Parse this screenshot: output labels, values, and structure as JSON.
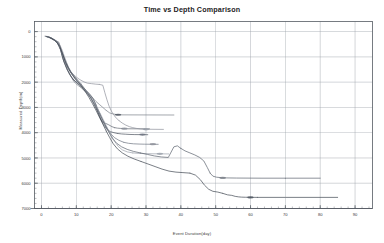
{
  "chart_data": {
    "type": "line",
    "title": "Time vs Depth Comparison",
    "xlabel": "Event Duration(day)",
    "ylabel": "Measured Depth(m)",
    "xlim": [
      -2,
      95
    ],
    "ylim": [
      7000,
      -400
    ],
    "y_inverted": true,
    "grid": true,
    "legend": "none",
    "xticks": [
      0,
      10,
      20,
      30,
      40,
      50,
      60,
      70,
      80,
      90
    ],
    "yticks": [
      0,
      1000,
      2000,
      3000,
      4000,
      5000,
      6000,
      7000
    ],
    "x_minor_tick_step": 2,
    "y_minor_tick_step": 200,
    "series": [
      {
        "name": "Well 1",
        "color": "#7a7f88",
        "points": [
          [
            1.0,
            180
          ],
          [
            2.2,
            200
          ],
          [
            3.0,
            300
          ],
          [
            3.6,
            330
          ],
          [
            4.2,
            360
          ],
          [
            5.0,
            420
          ],
          [
            5.6,
            700
          ],
          [
            6.0,
            980
          ],
          [
            6.4,
            1180
          ],
          [
            6.9,
            1300
          ],
          [
            7.4,
            1500
          ],
          [
            8.0,
            1680
          ],
          [
            8.6,
            1810
          ],
          [
            9.2,
            1950
          ],
          [
            9.8,
            2050
          ],
          [
            10.6,
            2140
          ],
          [
            11.4,
            2220
          ],
          [
            12.2,
            2330
          ],
          [
            13.0,
            2420
          ],
          [
            14.0,
            2520
          ],
          [
            14.8,
            2640
          ],
          [
            15.6,
            2760
          ],
          [
            16.6,
            2880
          ],
          [
            17.6,
            3000
          ],
          [
            18.6,
            3120
          ],
          [
            19.6,
            3220
          ],
          [
            20.6,
            3260
          ],
          [
            21.4,
            3280
          ],
          [
            22.0,
            3290
          ],
          [
            22.6,
            3295
          ],
          [
            38.0,
            3300
          ]
        ]
      },
      {
        "name": "Well 2",
        "color": "#5f6570",
        "points": [
          [
            1.2,
            190
          ],
          [
            2.5,
            230
          ],
          [
            3.4,
            320
          ],
          [
            4.4,
            400
          ],
          [
            5.2,
            560
          ],
          [
            5.8,
            880
          ],
          [
            6.3,
            1130
          ],
          [
            6.9,
            1340
          ],
          [
            7.6,
            1540
          ],
          [
            8.3,
            1720
          ],
          [
            9.0,
            1880
          ],
          [
            9.8,
            1980
          ],
          [
            10.8,
            2080
          ],
          [
            11.8,
            2200
          ],
          [
            12.8,
            2320
          ],
          [
            13.8,
            2460
          ],
          [
            14.8,
            2640
          ],
          [
            15.6,
            2900
          ],
          [
            16.2,
            3180
          ],
          [
            16.8,
            3400
          ],
          [
            17.4,
            3560
          ],
          [
            18.2,
            3620
          ],
          [
            19.2,
            3680
          ],
          [
            20.2,
            3760
          ],
          [
            21.0,
            3800
          ],
          [
            21.8,
            3820
          ],
          [
            22.6,
            3830
          ],
          [
            23.6,
            3840
          ],
          [
            24.4,
            3845
          ],
          [
            31.0,
            3850
          ]
        ]
      },
      {
        "name": "Well 3",
        "color": "#8d9099",
        "points": [
          [
            1.6,
            200
          ],
          [
            3.0,
            260
          ],
          [
            4.0,
            340
          ],
          [
            4.8,
            420
          ],
          [
            5.4,
            560
          ],
          [
            6.0,
            760
          ],
          [
            6.6,
            1000
          ],
          [
            7.2,
            1220
          ],
          [
            7.8,
            1420
          ],
          [
            8.4,
            1580
          ],
          [
            9.2,
            1700
          ],
          [
            10.0,
            1800
          ],
          [
            11.0,
            1900
          ],
          [
            12.2,
            1990
          ],
          [
            13.2,
            2040
          ],
          [
            14.4,
            2060
          ],
          [
            15.6,
            2080
          ],
          [
            16.6,
            2090
          ],
          [
            17.6,
            2120
          ],
          [
            18.2,
            2420
          ],
          [
            18.8,
            2700
          ],
          [
            19.4,
            2950
          ],
          [
            20.2,
            3180
          ],
          [
            21.2,
            3380
          ],
          [
            22.2,
            3520
          ],
          [
            23.2,
            3620
          ],
          [
            24.2,
            3700
          ],
          [
            25.2,
            3760
          ],
          [
            26.2,
            3800
          ],
          [
            27.2,
            3830
          ],
          [
            28.4,
            3850
          ],
          [
            29.6,
            3860
          ],
          [
            31.0,
            3865
          ],
          [
            35.0,
            3870
          ]
        ]
      },
      {
        "name": "Well 4",
        "color": "#4a515d",
        "points": [
          [
            1.4,
            195
          ],
          [
            2.8,
            250
          ],
          [
            3.8,
            350
          ],
          [
            4.6,
            470
          ],
          [
            5.4,
            700
          ],
          [
            6.0,
            980
          ],
          [
            6.6,
            1250
          ],
          [
            7.2,
            1460
          ],
          [
            7.9,
            1640
          ],
          [
            8.6,
            1800
          ],
          [
            9.4,
            1930
          ],
          [
            10.2,
            2040
          ],
          [
            11.2,
            2160
          ],
          [
            12.2,
            2300
          ],
          [
            13.2,
            2460
          ],
          [
            14.2,
            2640
          ],
          [
            15.0,
            2860
          ],
          [
            15.8,
            3080
          ],
          [
            16.6,
            3320
          ],
          [
            17.4,
            3560
          ],
          [
            18.2,
            3760
          ],
          [
            19.0,
            3900
          ],
          [
            19.8,
            3960
          ],
          [
            20.8,
            4000
          ],
          [
            21.8,
            4030
          ],
          [
            23.0,
            4050
          ],
          [
            24.2,
            4060
          ],
          [
            25.4,
            4070
          ],
          [
            26.8,
            4075
          ],
          [
            30.5,
            4080
          ]
        ]
      },
      {
        "name": "Well 5",
        "color": "#6b7280",
        "points": [
          [
            1.8,
            210
          ],
          [
            3.2,
            280
          ],
          [
            4.2,
            380
          ],
          [
            5.0,
            520
          ],
          [
            5.8,
            760
          ],
          [
            6.4,
            1020
          ],
          [
            7.0,
            1280
          ],
          [
            7.8,
            1480
          ],
          [
            8.6,
            1660
          ],
          [
            9.4,
            1820
          ],
          [
            10.2,
            1960
          ],
          [
            11.2,
            2100
          ],
          [
            12.2,
            2260
          ],
          [
            13.2,
            2420
          ],
          [
            14.2,
            2580
          ],
          [
            15.2,
            2760
          ],
          [
            16.0,
            3000
          ],
          [
            16.8,
            3260
          ],
          [
            17.6,
            3500
          ],
          [
            18.4,
            3720
          ],
          [
            19.2,
            3900
          ],
          [
            20.0,
            4060
          ],
          [
            21.0,
            4200
          ],
          [
            22.2,
            4300
          ],
          [
            23.6,
            4380
          ],
          [
            25.0,
            4420
          ],
          [
            26.4,
            4440
          ],
          [
            28.0,
            4450
          ],
          [
            29.6,
            4455
          ],
          [
            33.5,
            4460
          ]
        ]
      },
      {
        "name": "Well 6",
        "color": "#9aa0aa",
        "points": [
          [
            2.0,
            220
          ],
          [
            3.4,
            300
          ],
          [
            4.4,
            400
          ],
          [
            5.2,
            600
          ],
          [
            6.0,
            880
          ],
          [
            6.8,
            1160
          ],
          [
            7.6,
            1400
          ],
          [
            8.4,
            1600
          ],
          [
            9.2,
            1780
          ],
          [
            10.0,
            1940
          ],
          [
            11.0,
            2080
          ],
          [
            12.0,
            2240
          ],
          [
            13.0,
            2420
          ],
          [
            14.0,
            2600
          ],
          [
            15.0,
            2800
          ],
          [
            16.0,
            3020
          ],
          [
            17.0,
            3280
          ],
          [
            18.0,
            3560
          ],
          [
            19.0,
            3840
          ],
          [
            20.0,
            4100
          ],
          [
            21.0,
            4340
          ],
          [
            22.0,
            4540
          ],
          [
            23.2,
            4680
          ],
          [
            24.6,
            4760
          ],
          [
            26.2,
            4800
          ],
          [
            28.0,
            4820
          ],
          [
            30.0,
            4830
          ],
          [
            32.0,
            4835
          ],
          [
            36.5,
            4840
          ]
        ]
      },
      {
        "name": "Well 7",
        "color": "#585f6b",
        "points": [
          [
            1.5,
            200
          ],
          [
            3.0,
            270
          ],
          [
            4.2,
            390
          ],
          [
            5.2,
            580
          ],
          [
            6.0,
            860
          ],
          [
            6.8,
            1140
          ],
          [
            7.6,
            1380
          ],
          [
            8.4,
            1580
          ],
          [
            9.4,
            1760
          ],
          [
            10.4,
            1920
          ],
          [
            11.4,
            2080
          ],
          [
            12.4,
            2260
          ],
          [
            13.4,
            2460
          ],
          [
            14.4,
            2680
          ],
          [
            15.4,
            2920
          ],
          [
            16.4,
            3180
          ],
          [
            17.4,
            3460
          ],
          [
            18.4,
            3740
          ],
          [
            19.4,
            4000
          ],
          [
            20.4,
            4240
          ],
          [
            21.6,
            4420
          ],
          [
            23.0,
            4560
          ],
          [
            24.6,
            4660
          ],
          [
            26.4,
            4740
          ],
          [
            28.4,
            4800
          ],
          [
            30.4,
            4860
          ],
          [
            32.4,
            4920
          ],
          [
            34.4,
            4960
          ],
          [
            36.4,
            4980
          ],
          [
            38.0,
            4560
          ],
          [
            39.0,
            4520
          ],
          [
            40.0,
            4620
          ],
          [
            41.2,
            4720
          ],
          [
            42.6,
            4800
          ],
          [
            44.0,
            4880
          ],
          [
            45.4,
            4980
          ],
          [
            46.6,
            5120
          ],
          [
            47.6,
            5380
          ],
          [
            48.4,
            5600
          ],
          [
            49.2,
            5720
          ],
          [
            50.2,
            5760
          ],
          [
            51.6,
            5780
          ],
          [
            53.2,
            5790
          ],
          [
            56.0,
            5795
          ],
          [
            63.0,
            5800
          ],
          [
            70.0,
            5800
          ],
          [
            80.0,
            5800
          ]
        ]
      },
      {
        "name": "Well 8",
        "color": "#3e4550",
        "points": [
          [
            2.2,
            230
          ],
          [
            3.6,
            320
          ],
          [
            4.6,
            440
          ],
          [
            5.4,
            660
          ],
          [
            6.2,
            940
          ],
          [
            6.9,
            1220
          ],
          [
            7.7,
            1460
          ],
          [
            8.6,
            1660
          ],
          [
            9.6,
            1840
          ],
          [
            10.6,
            2000
          ],
          [
            11.6,
            2180
          ],
          [
            12.6,
            2380
          ],
          [
            13.6,
            2600
          ],
          [
            14.6,
            2840
          ],
          [
            15.6,
            3100
          ],
          [
            16.6,
            3380
          ],
          [
            17.6,
            3660
          ],
          [
            18.6,
            3940
          ],
          [
            19.6,
            4200
          ],
          [
            20.6,
            4440
          ],
          [
            21.8,
            4640
          ],
          [
            23.2,
            4800
          ],
          [
            24.8,
            4930
          ],
          [
            26.6,
            5040
          ],
          [
            28.6,
            5140
          ],
          [
            30.6,
            5240
          ],
          [
            32.6,
            5340
          ],
          [
            34.6,
            5440
          ],
          [
            36.6,
            5520
          ],
          [
            38.6,
            5560
          ],
          [
            40.6,
            5580
          ],
          [
            42.6,
            5600
          ],
          [
            44.2,
            5680
          ],
          [
            45.6,
            5860
          ],
          [
            46.8,
            6080
          ],
          [
            48.0,
            6240
          ],
          [
            49.2,
            6320
          ],
          [
            50.6,
            6350
          ],
          [
            52.0,
            6400
          ],
          [
            53.4,
            6460
          ],
          [
            54.6,
            6480
          ],
          [
            55.6,
            6520
          ],
          [
            56.6,
            6540
          ],
          [
            57.4,
            6550
          ],
          [
            58.6,
            6555
          ],
          [
            62.0,
            6560
          ],
          [
            70.0,
            6560
          ],
          [
            85.0,
            6560
          ]
        ]
      }
    ],
    "markers": [
      {
        "series": 0,
        "x": 22.0,
        "depth": 3290,
        "color": "#4a515d"
      },
      {
        "series": 1,
        "x": 23.8,
        "depth": 3840,
        "color": "#8a8f98"
      },
      {
        "series": 2,
        "x": 30.0,
        "depth": 3865,
        "color": "#9aa0aa"
      },
      {
        "series": 3,
        "x": 29.0,
        "depth": 4075,
        "color": "#6b7280"
      },
      {
        "series": 4,
        "x": 32.0,
        "depth": 4455,
        "color": "#8d9099"
      },
      {
        "series": 5,
        "x": 34.0,
        "depth": 4838,
        "color": "#9aa0aa"
      },
      {
        "series": 6,
        "x": 52.0,
        "depth": 5790,
        "color": "#7a7f88"
      },
      {
        "series": 7,
        "x": 60.0,
        "depth": 6560,
        "color": "#4a515d"
      }
    ]
  },
  "axes": {
    "x_tick_labels": [
      "0",
      "10",
      "20",
      "30",
      "40",
      "50",
      "60",
      "70",
      "80",
      "90"
    ],
    "y_tick_labels": [
      "0",
      "1000",
      "2000",
      "3000",
      "4000",
      "5000",
      "6000",
      "7000"
    ]
  },
  "colors": {
    "background": "#ffffff",
    "frame": "#555b63",
    "grid": "#9aa0a8",
    "text": "#2b2b2b"
  }
}
